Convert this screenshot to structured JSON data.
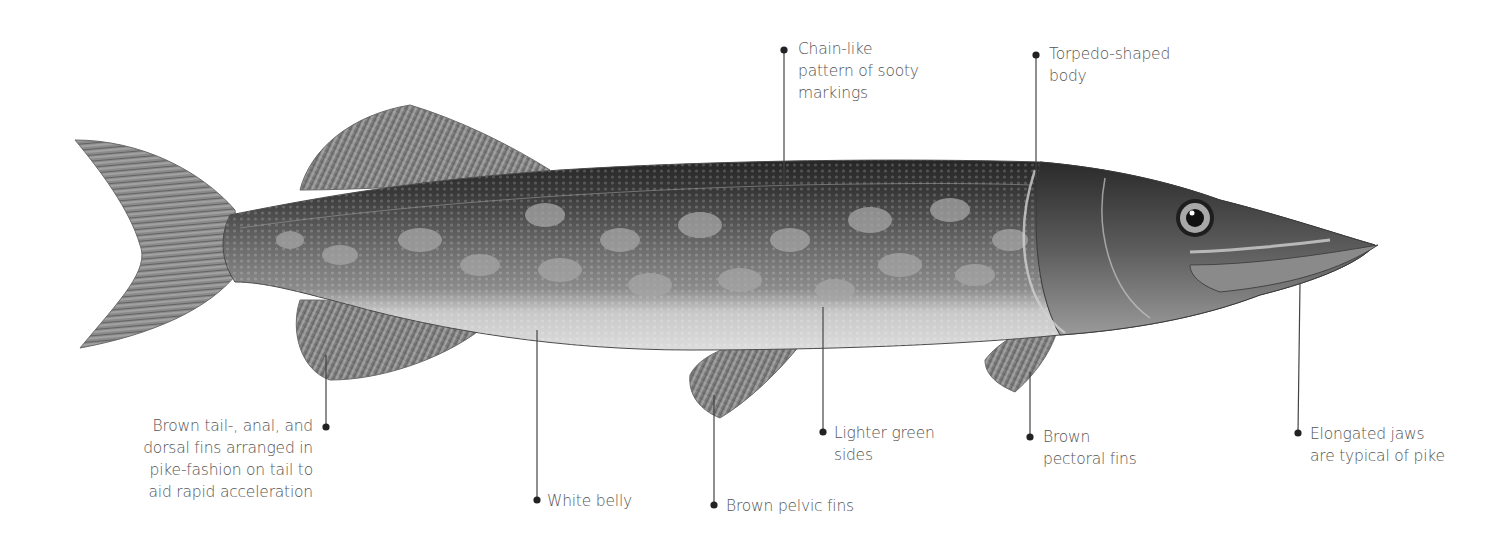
{
  "diagram": {
    "colors": {
      "background": "#ffffff",
      "label_text": "#555555",
      "leader_line": "#444444",
      "dot": "#222222",
      "back_dark": "#2e2e2e",
      "body_mid": "#6e6e6e",
      "spots_light": "#a8a8a8",
      "belly": "#d4d4d4",
      "fin": "#8a8a8a"
    },
    "labels": [
      {
        "id": "chain-pattern",
        "lines": [
          "Chain-like",
          "pattern of sooty",
          "markings"
        ]
      },
      {
        "id": "torpedo-body",
        "lines": [
          "Torpedo-shaped",
          "body"
        ]
      },
      {
        "id": "tail-fins",
        "lines": [
          "Brown tail-, anal, and",
          "dorsal fins arranged in",
          "pike-fashion on tail to",
          "aid rapid acceleration"
        ]
      },
      {
        "id": "white-belly",
        "lines": [
          "White belly"
        ]
      },
      {
        "id": "pelvic-fins",
        "lines": [
          "Brown pelvic fins"
        ]
      },
      {
        "id": "lighter-sides",
        "lines": [
          "Lighter green",
          "sides"
        ]
      },
      {
        "id": "pectoral-fins",
        "lines": [
          "Brown",
          "pectoral fins"
        ]
      },
      {
        "id": "elongated-jaws",
        "lines": [
          "Elongated jaws",
          "are typical of pike"
        ]
      }
    ]
  }
}
